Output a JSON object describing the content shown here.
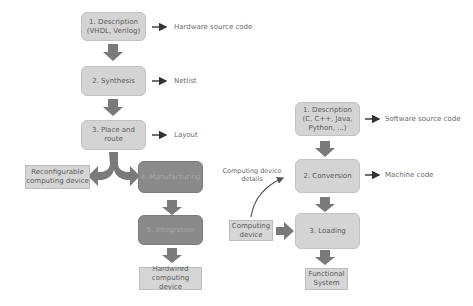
{
  "hardware_flow": {
    "steps": [
      {
        "label": "1. Description\n(VHDL, Verilog)",
        "output": "Hardware source code"
      },
      {
        "label": "2. Synthesis",
        "output": "Netlist"
      },
      {
        "label": "3. Place and\nroute",
        "output": "Layout"
      },
      {
        "label": "4. Manufacturing"
      },
      {
        "label": "5. Integration"
      }
    ],
    "branch_reconfigurable": "Reconfigurable\ncomputing device",
    "result_hardwired": "Hardwired\ncomputing device"
  },
  "software_flow": {
    "steps": [
      {
        "label": "1. Description\n(C, C++, Java,\nPython, ...)",
        "output": "Software source code"
      },
      {
        "label": "2. Conversion",
        "output": "Machine code"
      },
      {
        "label": "3. Loading"
      }
    ],
    "input_device": "Computing\ndevice",
    "device_details_note": "Computing device\ndetails",
    "result": "Functional\nSystem"
  },
  "colors": {
    "light_box": "#d4d4d4",
    "dark_box": "#8a8a8a",
    "arrow": "#7a7a7a",
    "small_arrow": "#333333"
  }
}
